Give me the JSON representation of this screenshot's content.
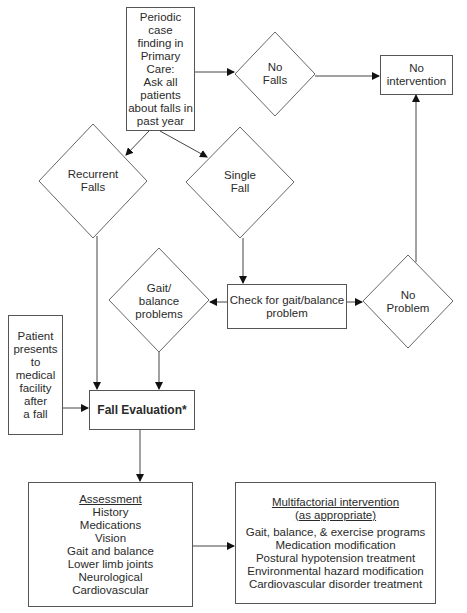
{
  "diagram": {
    "type": "flowchart",
    "nodes": {
      "periodic": {
        "shape": "rectangle",
        "lines": [
          "Periodic case",
          "finding in",
          "Primary",
          "Care:",
          "Ask all",
          "patients",
          "about falls in",
          "past year"
        ]
      },
      "no_falls": {
        "shape": "diamond",
        "lines": [
          "No",
          "Falls"
        ]
      },
      "no_intervention": {
        "shape": "rectangle",
        "lines": [
          "No",
          "intervention"
        ]
      },
      "recurrent_falls": {
        "shape": "diamond",
        "lines": [
          "Recurrent",
          "Falls"
        ]
      },
      "single_fall": {
        "shape": "diamond",
        "lines": [
          "Single",
          "Fall"
        ]
      },
      "gait_balance_problems": {
        "shape": "diamond",
        "lines": [
          "Gait/",
          "balance",
          "problems"
        ]
      },
      "check_gait": {
        "shape": "rectangle",
        "lines": [
          "Check for gait/balance",
          "problem"
        ]
      },
      "no_problem": {
        "shape": "diamond",
        "lines": [
          "No",
          "Problem"
        ]
      },
      "patient_presents": {
        "shape": "rectangle",
        "lines": [
          "Patient",
          "presents",
          "to",
          "medical",
          "facility",
          "after",
          "a fall"
        ]
      },
      "fall_evaluation": {
        "shape": "rectangle",
        "label": "Fall Evaluation*"
      },
      "assessment": {
        "shape": "rectangle",
        "heading": "Assessment",
        "items": [
          "History",
          "Medications",
          "Vision",
          "Gait and balance",
          "Lower limb joints",
          "Neurological",
          "Cardiovascular"
        ]
      },
      "multifactorial": {
        "shape": "rectangle",
        "heading_lines": [
          "Multifactorial intervention",
          "(as appropriate)"
        ],
        "items": [
          "Gait, balance, & exercise programs",
          "Medication modification",
          "Postural hypotension treatment",
          "Environmental hazard modification",
          "Cardiovascular disorder treatment"
        ]
      }
    },
    "edges": [
      [
        "periodic",
        "no_falls"
      ],
      [
        "no_falls",
        "no_intervention"
      ],
      [
        "periodic",
        "recurrent_falls"
      ],
      [
        "periodic",
        "single_fall"
      ],
      [
        "single_fall",
        "check_gait"
      ],
      [
        "check_gait",
        "gait_balance_problems"
      ],
      [
        "check_gait",
        "no_problem"
      ],
      [
        "no_problem",
        "no_intervention"
      ],
      [
        "recurrent_falls",
        "fall_evaluation"
      ],
      [
        "gait_balance_problems",
        "fall_evaluation"
      ],
      [
        "patient_presents",
        "fall_evaluation"
      ],
      [
        "fall_evaluation",
        "assessment"
      ],
      [
        "assessment",
        "multifactorial"
      ]
    ],
    "colors": {
      "stroke": "#555555",
      "text": "#2a2a2a",
      "background": "#ffffff"
    }
  }
}
